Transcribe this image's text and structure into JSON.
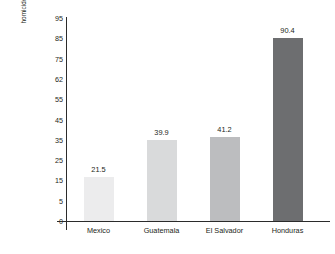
{
  "chart_data": {
    "type": "bar",
    "title": "",
    "xlabel": "",
    "ylabel": "homicides per 100,000 inhabitants",
    "categories": [
      "Mexico",
      "Guatemala",
      "El Salvador",
      "Honduras"
    ],
    "values": [
      21.5,
      39.9,
      41.2,
      90.4
    ],
    "value_labels": [
      "21.5",
      "39.9",
      "41.2",
      "90.4"
    ],
    "bar_colors": [
      "#ececed",
      "#d9dadb",
      "#bcbdbf",
      "#6d6e70"
    ],
    "ytick_labels": [
      "95",
      "85",
      "75",
      "62",
      "55",
      "45",
      "35",
      "25",
      "15",
      "5",
      "0"
    ],
    "ylim": [
      0,
      100
    ],
    "grid": false,
    "legend": null,
    "axis_color": "#2b2b2b",
    "background": "#ffffff"
  }
}
